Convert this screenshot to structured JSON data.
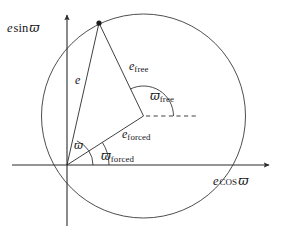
{
  "figure": {
    "type": "vector-diagram",
    "stroke_color": "#2b2b2b",
    "background_color": "#ffffff",
    "text_color": "#181818"
  },
  "axes": {
    "y_label": {
      "symbol": "e",
      "func": "sin",
      "angle": "ϖ"
    },
    "x_label": {
      "symbol": "e",
      "func": "cos",
      "angle": "ϖ"
    },
    "origin": {
      "x": 67,
      "y": 165
    },
    "x_axis_tip": {
      "x": 271,
      "y": 165
    },
    "y_axis_tip": {
      "x": 67,
      "y": 13
    }
  },
  "circle": {
    "center": {
      "x": 143.5,
      "y": 116
    },
    "radius": 102,
    "label": "free eccentricity circle"
  },
  "points": {
    "origin": {
      "x": 67,
      "y": 165
    },
    "forced": {
      "x": 143.5,
      "y": 116
    },
    "total": {
      "x": 99,
      "y": 23,
      "marker": "filled-dot"
    },
    "dashed_end": {
      "x": 199,
      "y": 116
    }
  },
  "vectors": [
    {
      "name": "e",
      "label": "e",
      "from": "origin",
      "to": "total"
    },
    {
      "name": "e_forced",
      "label": "e",
      "subscript": "forced",
      "from": "origin",
      "to": "forced"
    },
    {
      "name": "e_free",
      "label": "e",
      "subscript": "free",
      "from": "forced",
      "to": "total"
    }
  ],
  "labels": {
    "e": {
      "symbol": "e",
      "sub": ""
    },
    "e_free": {
      "symbol": "e",
      "sub": "free"
    },
    "e_forced": {
      "symbol": "e",
      "sub": "forced"
    },
    "varpi": {
      "symbol": "ϖ",
      "sub": ""
    },
    "varpi_free": {
      "symbol": "ϖ",
      "sub": "free"
    },
    "varpi_forced": {
      "symbol": "ϖ",
      "sub": "forced"
    }
  },
  "angles": [
    {
      "name": "varpi",
      "vertex": "origin",
      "from_deg": 0,
      "to_deg": 67.6,
      "radius": 26
    },
    {
      "name": "varpi_forced",
      "vertex": "origin",
      "from_deg": 0,
      "to_deg": 32.6,
      "radius": 42
    },
    {
      "name": "varpi_free",
      "vertex": "forced",
      "from_deg": 0,
      "to_deg": 116.4,
      "radius": 30
    }
  ]
}
